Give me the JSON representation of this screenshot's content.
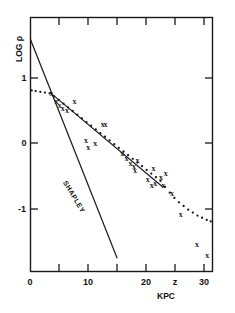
{
  "chart_data": {
    "type": "scatter",
    "title": "",
    "xlabel": "KPC",
    "ylabel": "LOG ρ",
    "xlim": [
      0,
      31.5
    ],
    "ylim": [
      -2.0,
      1.45
    ],
    "grid": false,
    "legend_position": "inline-annotation",
    "x_tick_values": [
      0,
      5,
      10,
      15,
      20,
      25,
      30
    ],
    "x_tick_labels": [
      "0",
      "",
      "10",
      "",
      "20",
      "z",
      "30"
    ],
    "y_tick_values": [
      1,
      0,
      -1
    ],
    "y_tick_labels": [
      "1",
      "0",
      "-1"
    ],
    "annotations": [
      {
        "text": "SHAPLEY",
        "x": 7.2,
        "y": -1.0,
        "rotation": 59
      }
    ],
    "series": [
      {
        "name": "SHAPLEY",
        "type": "line",
        "style": "solid",
        "points": [
          [
            0.0,
            1.15
          ],
          [
            15.0,
            -1.82
          ]
        ]
      },
      {
        "name": "fitted-line",
        "type": "line",
        "style": "solid",
        "points": [
          [
            3.4,
            0.43
          ],
          [
            23.0,
            -0.86
          ]
        ]
      },
      {
        "name": "dotted-curve",
        "type": "scatter",
        "style": "dotted",
        "points": [
          [
            0.2,
            0.46
          ],
          [
            0.9,
            0.45
          ],
          [
            1.7,
            0.44
          ],
          [
            2.5,
            0.43
          ],
          [
            3.3,
            0.42
          ],
          [
            4.1,
            0.38
          ],
          [
            4.9,
            0.33
          ],
          [
            5.7,
            0.28
          ],
          [
            6.5,
            0.23
          ],
          [
            7.3,
            0.18
          ],
          [
            8.1,
            0.13
          ],
          [
            8.9,
            0.08
          ],
          [
            9.7,
            0.03
          ],
          [
            10.5,
            -0.02
          ],
          [
            11.3,
            -0.07
          ],
          [
            12.1,
            -0.12
          ],
          [
            12.9,
            -0.17
          ],
          [
            13.7,
            -0.22
          ],
          [
            14.5,
            -0.27
          ],
          [
            15.3,
            -0.32
          ],
          [
            16.1,
            -0.37
          ],
          [
            16.9,
            -0.42
          ],
          [
            17.7,
            -0.47
          ],
          [
            18.5,
            -0.52
          ],
          [
            19.3,
            -0.57
          ],
          [
            20.1,
            -0.62
          ],
          [
            20.9,
            -0.67
          ],
          [
            21.7,
            -0.72
          ],
          [
            22.5,
            -0.77
          ],
          [
            23.3,
            -0.85
          ],
          [
            24.1,
            -0.93
          ],
          [
            24.9,
            -1.0
          ],
          [
            25.7,
            -1.06
          ],
          [
            26.5,
            -1.11
          ],
          [
            27.3,
            -1.16
          ],
          [
            28.1,
            -1.2
          ],
          [
            28.9,
            -1.24
          ],
          [
            29.7,
            -1.27
          ],
          [
            30.5,
            -1.3
          ],
          [
            31.2,
            -1.32
          ]
        ]
      },
      {
        "name": "observations",
        "type": "scatter",
        "marker": "x",
        "points": [
          [
            3.6,
            0.42
          ],
          [
            4.5,
            0.32
          ],
          [
            5.0,
            0.26
          ],
          [
            5.6,
            0.22
          ],
          [
            6.3,
            0.2
          ],
          [
            7.6,
            0.31
          ],
          [
            9.6,
            -0.21
          ],
          [
            10.0,
            -0.31
          ],
          [
            11.2,
            -0.25
          ],
          [
            12.5,
            0.01
          ],
          [
            13.0,
            0.0
          ],
          [
            15.9,
            -0.39
          ],
          [
            16.6,
            -0.46
          ],
          [
            17.3,
            -0.52
          ],
          [
            17.9,
            -0.57
          ],
          [
            18.5,
            -0.49
          ],
          [
            18.1,
            -0.62
          ],
          [
            20.3,
            -0.74
          ],
          [
            21.0,
            -0.82
          ],
          [
            21.6,
            -0.8
          ],
          [
            21.3,
            -0.6
          ],
          [
            22.6,
            -0.71
          ],
          [
            23.4,
            -0.66
          ],
          [
            23.0,
            -0.83
          ],
          [
            24.5,
            -0.93
          ],
          [
            26.0,
            -1.22
          ],
          [
            28.8,
            -1.63
          ],
          [
            30.6,
            -1.77
          ]
        ]
      }
    ]
  },
  "axis": {
    "y_label": "LOG ρ",
    "x_label": "KPC",
    "x_tick_0": "0",
    "x_tick_10": "10",
    "x_tick_20": "20",
    "x_tick_25": "z",
    "x_tick_30": "30",
    "y_tick_1": "1",
    "y_tick_0": "0",
    "y_tick_m1": "-1"
  },
  "labels": {
    "shapley": "SHAPLEY"
  },
  "colors": {
    "ink": "#1a1a1a",
    "background": "#ffffff"
  }
}
